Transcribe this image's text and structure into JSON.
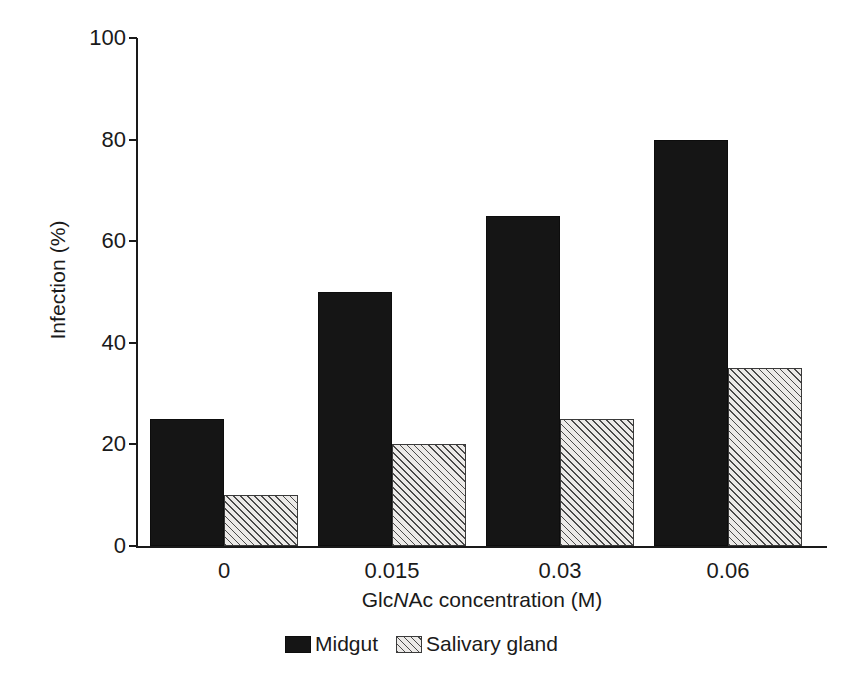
{
  "chart_data": {
    "type": "bar",
    "title": "",
    "subtitle": "",
    "xlabel": "GlcNAc concentration (M)",
    "xlabel_parts": {
      "pre": "Glc",
      "italic": "N",
      "post": "Ac concentration (M)"
    },
    "ylabel": "Infection (%)",
    "categories": [
      "0",
      "0.015",
      "0.03",
      "0.06"
    ],
    "ylim": [
      0,
      100
    ],
    "yticks": [
      0,
      20,
      40,
      60,
      80,
      100
    ],
    "ytick_labels": [
      "0",
      "20",
      "40",
      "60",
      "80",
      "100"
    ],
    "grid": false,
    "legend_position": "bottom-center",
    "series": [
      {
        "name": "Midgut",
        "fill": "solid-black",
        "color": "#151515",
        "values": [
          25,
          50,
          65,
          80
        ]
      },
      {
        "name": "Salivary gland",
        "fill": "diagonal-hatch",
        "color": "#eceae8",
        "values": [
          10,
          20,
          25,
          35
        ]
      }
    ]
  },
  "legend": {
    "items": [
      {
        "label": "Midgut",
        "swatch": "solid-black-swatch"
      },
      {
        "label": "Salivary gland",
        "swatch": "hatched-swatch"
      }
    ]
  },
  "axes": {
    "y_axis_label": "Infection (%)",
    "x_axis_label": "GlcNAc concentration (M)"
  }
}
